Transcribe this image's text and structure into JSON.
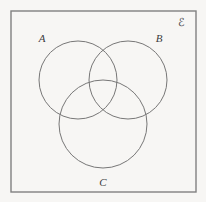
{
  "figure": {
    "name": "three-set-venn-diagram",
    "background_color": "#f7f6f4",
    "width": 206,
    "height": 202
  },
  "universe": {
    "label": "ℰ",
    "label_name": "universal-set-symbol",
    "rect": {
      "x": 11,
      "y": 11,
      "width": 185,
      "height": 181
    },
    "stroke_color": "#808080",
    "stroke_width": 1.4,
    "fill": "none",
    "label_x": 181,
    "label_y": 26
  },
  "sets": [
    {
      "label": "A",
      "name": "circle-a",
      "cx": 78,
      "cy": 80,
      "r": 39,
      "stroke_color": "#777777",
      "stroke_width": 1,
      "fill": "none",
      "label_x": 42,
      "label_y": 42
    },
    {
      "label": "B",
      "name": "circle-b",
      "cx": 128,
      "cy": 80,
      "r": 39,
      "stroke_color": "#777777",
      "stroke_width": 1,
      "fill": "none",
      "label_x": 159,
      "label_y": 42
    },
    {
      "label": "C",
      "name": "circle-c",
      "cx": 103,
      "cy": 124,
      "r": 44,
      "stroke_color": "#777777",
      "stroke_width": 1,
      "fill": "none",
      "label_x": 103,
      "label_y": 186
    }
  ]
}
